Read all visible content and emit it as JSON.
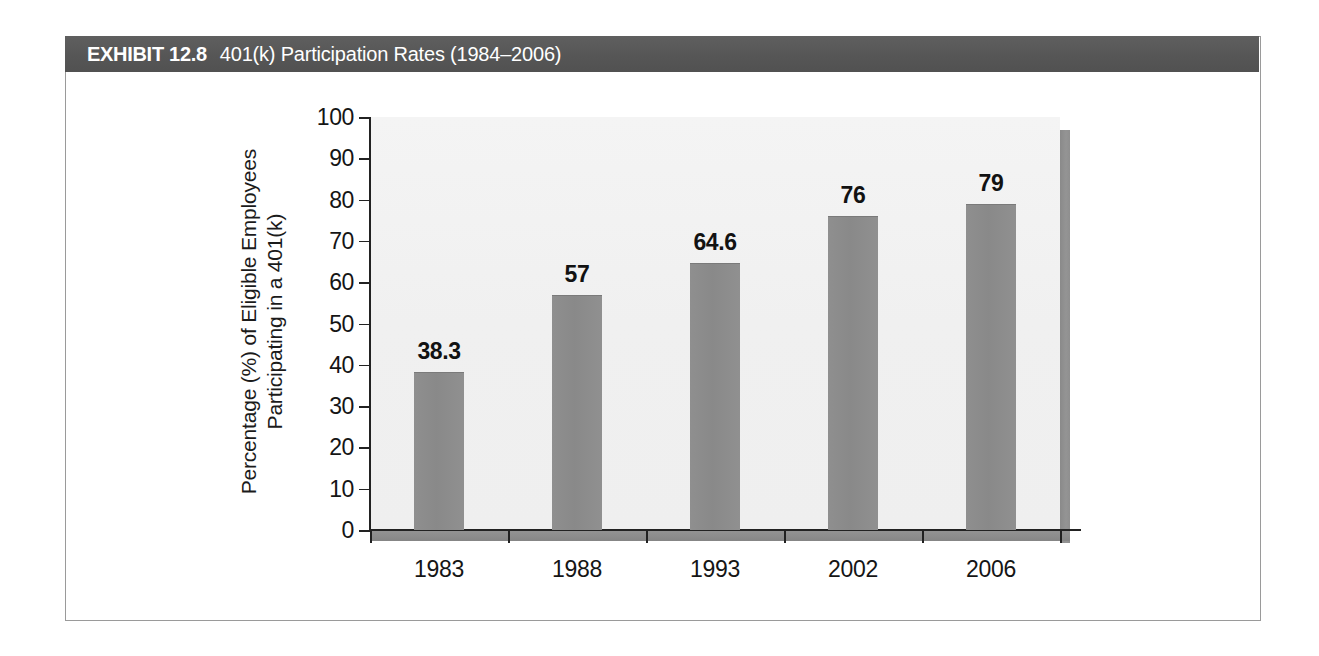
{
  "exhibit": {
    "label": "EXHIBIT 12.8",
    "title": "401(k) Participation Rates (1984–2006)"
  },
  "colors": {
    "header_bar": "#595959",
    "header_text": "#ffffff",
    "frame_border": "#9a9a9a",
    "plot_background": "#f2f2f2",
    "bar_fill": "#8c8c8c",
    "wall_fill": "#8d8d8d",
    "axis": "#222222",
    "text": "#151515"
  },
  "chart_data": {
    "type": "bar",
    "title": "401(k) Participation Rates (1984–2006)",
    "categories": [
      "1983",
      "1988",
      "1993",
      "2002",
      "2006"
    ],
    "values": [
      38.3,
      57,
      64.6,
      76,
      79
    ],
    "data_labels": [
      "38.3",
      "57",
      "64.6",
      "76",
      "79"
    ],
    "xlabel": "",
    "ylabel_line1": "Percentage (%) of Eligible Employees",
    "ylabel_line2": "Participating in a 401(k)",
    "ylim": [
      0,
      100
    ],
    "yticks": [
      0,
      10,
      20,
      30,
      40,
      50,
      60,
      70,
      80,
      90,
      100
    ],
    "ytick_labels": [
      "0",
      "10",
      "20",
      "30",
      "40",
      "50",
      "60",
      "70",
      "80",
      "90",
      "100"
    ],
    "grid": false,
    "legend": false,
    "series": [
      {
        "name": "Participation Rate",
        "values": [
          38.3,
          57,
          64.6,
          76,
          79
        ]
      }
    ]
  }
}
